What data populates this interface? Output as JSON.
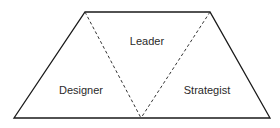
{
  "diagram": {
    "type": "trapezoid-triangle-division",
    "outline_color": "#1a1a1a",
    "divider_color": "#333333",
    "regions": [
      {
        "id": "leader",
        "label": "Leader",
        "x": 147,
        "y": 41
      },
      {
        "id": "designer",
        "label": "Designer",
        "x": 81,
        "y": 90
      },
      {
        "id": "strategist",
        "label": "Strategist",
        "x": 207,
        "y": 90
      }
    ],
    "vertices": {
      "top_left": [
        85,
        12
      ],
      "top_right": [
        210,
        12
      ],
      "bottom_left": [
        14,
        118
      ],
      "bottom_right": [
        270,
        118
      ],
      "bottom_middle": [
        141,
        118
      ]
    }
  }
}
